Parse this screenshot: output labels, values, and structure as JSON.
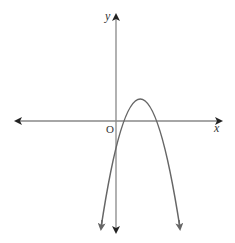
{
  "diagram": {
    "type": "coordinate-plane-parabola",
    "axes": {
      "x_label": "x",
      "y_label": "y",
      "origin_label": "O",
      "color": "#555555"
    },
    "curve": {
      "shape": "downward-opening parabola",
      "vertex_position": "above x-axis, right of y-axis",
      "y_intercept": "negative (below origin)",
      "x_intercepts": "two positive roots",
      "color": "#666666"
    }
  }
}
